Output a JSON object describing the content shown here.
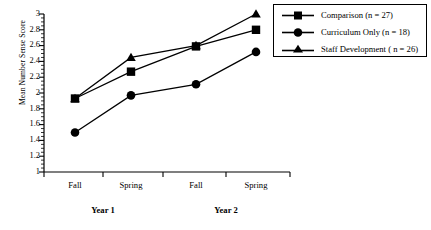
{
  "chart_data": {
    "type": "line",
    "title": "",
    "xlabel": "",
    "ylabel": "Mean Number Sense Score",
    "categories": [
      "Fall",
      "Spring",
      "Fall",
      "Spring"
    ],
    "group_labels": [
      "Year 1",
      "Year 2"
    ],
    "ylim": [
      1,
      3
    ],
    "ytick_labels": [
      "1",
      "1.2",
      "1.4",
      "1.6",
      "1.8",
      "2",
      "2.2",
      "2.4",
      "2.6",
      "2.8",
      "3"
    ],
    "ytick_values": [
      1,
      1.2,
      1.4,
      1.6,
      1.8,
      2,
      2.2,
      2.4,
      2.6,
      2.8,
      3
    ],
    "minor_tick_step": 0.05,
    "grid": false,
    "legend_position": "right",
    "series": [
      {
        "name": "Comparison (n = 27)",
        "marker": "square",
        "values": [
          1.93,
          2.27,
          2.59,
          2.8
        ]
      },
      {
        "name": "Curriculum Only (n = 18)",
        "marker": "circle",
        "values": [
          1.5,
          1.97,
          2.11,
          2.52
        ]
      },
      {
        "name": "Staff Development ( n = 26)",
        "marker": "triangle",
        "values": [
          1.93,
          2.45,
          2.6,
          3.0
        ]
      }
    ]
  },
  "axes": {
    "y_title": "Mean Number Sense Score"
  },
  "legend": {
    "entries": [
      "Comparison (n = 27)",
      "Curriculum Only (n = 18)",
      "Staff Development ( n = 26)"
    ]
  },
  "colors": {
    "line": "#000000",
    "marker": "#000000",
    "axis": "#000000",
    "background": "#ffffff"
  }
}
